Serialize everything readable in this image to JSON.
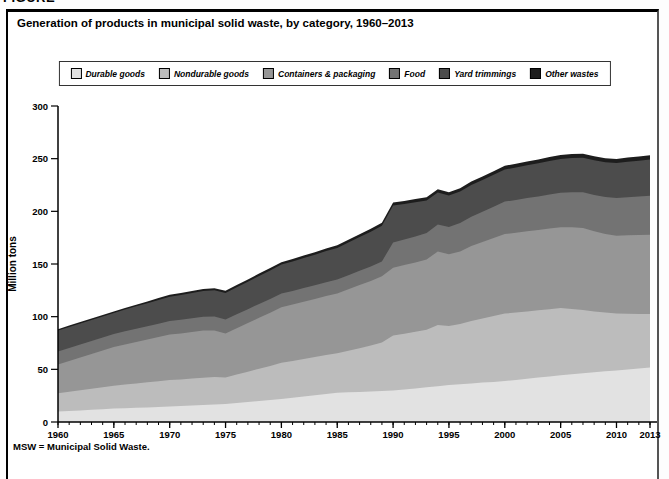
{
  "page": {
    "figure_label": "FIGURE",
    "title": "Generation of products in municipal solid waste, by category, 1960–2013",
    "footnote": "MSW = Municipal Solid Waste."
  },
  "chart_data": {
    "type": "area",
    "stacked": true,
    "title": "Generation of products in municipal solid waste, by category, 1960–2013",
    "xlabel": "",
    "ylabel": "Million tons",
    "ylim": [
      0,
      300
    ],
    "yticks": [
      0,
      50,
      100,
      150,
      200,
      250,
      300
    ],
    "xticks": [
      1960,
      1965,
      1970,
      1975,
      1980,
      1985,
      1990,
      1995,
      2000,
      2005,
      2010,
      2013
    ],
    "legend_position": "top",
    "grid": false,
    "x": [
      1960,
      1961,
      1962,
      1963,
      1964,
      1965,
      1966,
      1967,
      1968,
      1969,
      1970,
      1971,
      1972,
      1973,
      1974,
      1975,
      1976,
      1977,
      1978,
      1979,
      1980,
      1981,
      1982,
      1983,
      1984,
      1985,
      1986,
      1987,
      1988,
      1989,
      1990,
      1991,
      1992,
      1993,
      1994,
      1995,
      1996,
      1997,
      1998,
      1999,
      2000,
      2001,
      2002,
      2003,
      2004,
      2005,
      2006,
      2007,
      2008,
      2009,
      2010,
      2011,
      2012,
      2013
    ],
    "series": [
      {
        "name": "Durable goods",
        "color": "#e2e2e2",
        "values": [
          9.9,
          10.5,
          11.0,
          11.6,
          12.1,
          12.7,
          13.1,
          13.5,
          13.9,
          14.3,
          14.7,
          15.1,
          15.6,
          16.1,
          16.6,
          17.0,
          18.0,
          18.9,
          19.9,
          20.8,
          21.8,
          23.0,
          24.2,
          25.4,
          26.6,
          27.8,
          28.2,
          28.6,
          29.0,
          29.4,
          29.8,
          30.9,
          31.9,
          33.0,
          34.0,
          35.1,
          35.9,
          36.6,
          37.4,
          38.1,
          38.9,
          40.0,
          41.1,
          42.2,
          43.3,
          44.4,
          45.3,
          46.2,
          47.2,
          48.1,
          49.0,
          49.9,
          50.7,
          51.6
        ]
      },
      {
        "name": "Nondurable goods",
        "color": "#bcbcbc",
        "values": [
          17.3,
          18.2,
          19.1,
          20.0,
          20.9,
          21.8,
          22.5,
          23.1,
          23.8,
          24.4,
          25.1,
          25.3,
          25.6,
          25.9,
          26.0,
          25.2,
          27.0,
          28.8,
          30.7,
          32.5,
          34.4,
          35.0,
          35.6,
          36.2,
          36.9,
          37.5,
          39.5,
          41.5,
          43.5,
          46.0,
          52.2,
          52.9,
          53.7,
          54.5,
          58.0,
          56.1,
          57.0,
          59.3,
          60.8,
          62.4,
          64.0,
          63.9,
          63.9,
          63.8,
          63.8,
          63.7,
          62.0,
          60.0,
          57.8,
          55.8,
          53.9,
          52.9,
          51.9,
          50.9
        ]
      },
      {
        "name": "Containers & packaging",
        "color": "#969696",
        "values": [
          27.4,
          29.3,
          31.1,
          33.0,
          34.9,
          36.7,
          38.0,
          39.3,
          40.6,
          41.9,
          43.2,
          43.7,
          44.3,
          44.8,
          44.3,
          41.8,
          44.0,
          46.2,
          48.3,
          50.5,
          52.7,
          53.5,
          54.3,
          55.1,
          56.0,
          56.8,
          58.3,
          59.9,
          61.4,
          63.0,
          64.5,
          65.2,
          65.9,
          66.7,
          70.0,
          68.1,
          69.0,
          71.1,
          72.6,
          74.1,
          75.6,
          75.8,
          76.0,
          76.2,
          76.5,
          76.7,
          77.5,
          78.0,
          76.0,
          74.5,
          74.0,
          74.4,
          74.8,
          75.2
        ]
      },
      {
        "name": "Food",
        "color": "#737373",
        "values": [
          12.2,
          12.2,
          12.3,
          12.3,
          12.4,
          12.4,
          12.5,
          12.6,
          12.6,
          12.7,
          12.8,
          12.9,
          13.0,
          13.2,
          13.3,
          13.4,
          13.3,
          13.2,
          13.2,
          13.1,
          13.0,
          13.0,
          13.1,
          13.1,
          13.2,
          13.2,
          13.4,
          13.6,
          13.8,
          14.0,
          23.9,
          24.3,
          24.7,
          25.1,
          25.5,
          25.9,
          26.9,
          27.8,
          28.8,
          29.7,
          30.7,
          31.1,
          31.6,
          32.0,
          32.5,
          32.9,
          33.4,
          34.0,
          34.6,
          35.1,
          35.7,
          36.2,
          36.6,
          37.1
        ]
      },
      {
        "name": "Yard trimmings",
        "color": "#4c4c4c",
        "values": [
          20.0,
          20.0,
          20.0,
          20.0,
          20.0,
          20.0,
          20.6,
          21.3,
          21.9,
          22.6,
          23.2,
          23.6,
          24.0,
          24.4,
          24.8,
          25.2,
          25.7,
          26.1,
          26.6,
          27.0,
          27.5,
          28.0,
          28.5,
          29.0,
          29.5,
          30.0,
          31.0,
          32.0,
          33.0,
          34.0,
          35.0,
          33.7,
          32.4,
          31.1,
          30.4,
          29.8,
          29.9,
          30.1,
          30.2,
          30.4,
          30.5,
          30.8,
          31.1,
          31.5,
          31.8,
          32.1,
          32.4,
          32.6,
          32.9,
          33.1,
          33.4,
          33.7,
          34.1,
          34.5
        ]
      },
      {
        "name": "Other wastes",
        "color": "#1d1d1d",
        "values": [
          1.3,
          1.3,
          1.3,
          1.4,
          1.4,
          1.4,
          1.5,
          1.6,
          1.6,
          1.7,
          1.8,
          1.8,
          1.9,
          1.9,
          2.0,
          2.0,
          2.1,
          2.1,
          2.2,
          2.2,
          2.3,
          2.3,
          2.4,
          2.4,
          2.5,
          2.5,
          2.6,
          2.7,
          2.7,
          2.8,
          2.9,
          2.9,
          3.0,
          3.0,
          3.1,
          3.1,
          3.2,
          3.3,
          3.3,
          3.4,
          3.5,
          3.5,
          3.6,
          3.6,
          3.7,
          3.7,
          3.7,
          3.8,
          3.8,
          3.8,
          3.8,
          3.9,
          3.9,
          4.0
        ]
      }
    ]
  }
}
